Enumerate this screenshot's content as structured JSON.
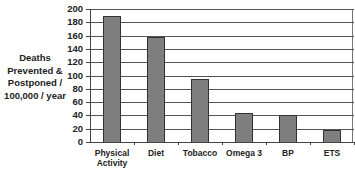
{
  "chart_data": {
    "type": "bar",
    "title": "",
    "xlabel": "",
    "ylabel": "Deaths Prevented & Postponed / 100,000 / year",
    "ylabel_lines": [
      "Deaths",
      "Prevented &",
      "Postponed /",
      "100,000 / year"
    ],
    "categories": [
      "Physical Activity",
      "Diet",
      "Tobacco",
      "Omega 3",
      "BP",
      "ETS"
    ],
    "category_lines": [
      [
        "Physical",
        "Activity"
      ],
      [
        "Diet"
      ],
      [
        "Tobacco"
      ],
      [
        "Omega 3"
      ],
      [
        "BP"
      ],
      [
        "ETS"
      ]
    ],
    "values": [
      190,
      158,
      95,
      43,
      41,
      18
    ],
    "ylim": [
      0,
      200
    ],
    "yticks": [
      0,
      20,
      40,
      60,
      80,
      100,
      120,
      140,
      160,
      180,
      200
    ],
    "grid": true,
    "legend": null,
    "bar_color": "#7f7f7f"
  }
}
